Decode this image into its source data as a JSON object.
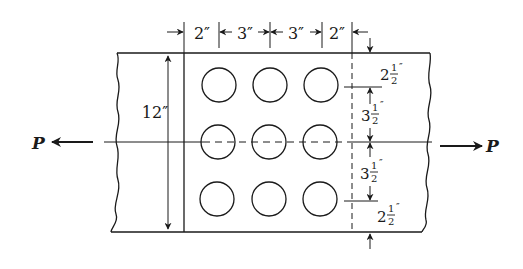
{
  "diagram": {
    "type": "bolted-plate-connection",
    "force_label_left": "P",
    "force_label_right": "P",
    "plate_width_label": "12″",
    "top_dimensions": [
      "2″",
      "3″",
      "3″",
      "2″"
    ],
    "right_dimensions": [
      {
        "whole": "2",
        "num": "1",
        "den": "2",
        "mark": "″"
      },
      {
        "whole": "3",
        "num": "1",
        "den": "2",
        "mark": "″"
      },
      {
        "whole": "3",
        "num": "1",
        "den": "2",
        "mark": "″"
      },
      {
        "whole": "2",
        "num": "1",
        "den": "2",
        "mark": "″"
      }
    ],
    "holes": {
      "rows": 3,
      "columns": 3
    },
    "colors": {
      "line": "#1a1a1a",
      "background": "#ffffff"
    }
  }
}
